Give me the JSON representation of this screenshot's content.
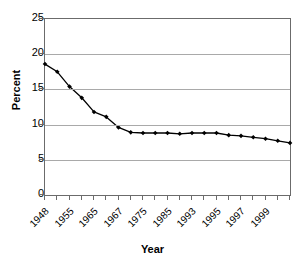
{
  "chart_data": {
    "type": "line",
    "title": "",
    "xlabel": "Year",
    "ylabel": "Percent",
    "ylim": [
      0,
      25
    ],
    "ytick_values": [
      0,
      5,
      10,
      15,
      20,
      25
    ],
    "ytick_labels": [
      "0",
      "5",
      "10",
      "15",
      "20",
      "25"
    ],
    "grid": "horizontal",
    "legend": "none",
    "marker": "filled-diamond",
    "line_color": "#000000",
    "marker_color": "#000000",
    "grid_color": "#a9a9a9",
    "axis_color": "#6b6b6b",
    "xtick_labels": [
      "1948",
      "1955",
      "1965",
      "1967",
      "1975",
      "1985",
      "1993",
      "1995",
      "1997",
      "1999"
    ],
    "xtick_label_positions": [
      0,
      2,
      4,
      6,
      8,
      10,
      12,
      14,
      16,
      18
    ],
    "n_ticks": 21,
    "x": [
      "1948",
      "1955",
      "1960",
      "1965",
      "1966",
      "1967",
      "1970",
      "1975",
      "1980",
      "1983",
      "1985",
      "1988",
      "1990",
      "1993",
      "1994",
      "1995",
      "1996",
      "1997",
      "1998",
      "1999",
      "2000"
    ],
    "values": [
      18.6,
      17.5,
      15.4,
      13.8,
      11.8,
      11.1,
      9.6,
      8.9,
      8.8,
      8.8,
      8.8,
      8.7,
      8.8,
      8.8,
      8.8,
      8.5,
      8.4,
      8.2,
      8.0,
      7.7,
      7.4
    ],
    "series": [
      {
        "name": "Percent",
        "values": [
          18.6,
          17.5,
          15.4,
          13.8,
          11.8,
          11.1,
          9.6,
          8.9,
          8.8,
          8.8,
          8.8,
          8.7,
          8.8,
          8.8,
          8.8,
          8.5,
          8.4,
          8.2,
          8.0,
          7.7,
          7.4
        ]
      }
    ]
  }
}
